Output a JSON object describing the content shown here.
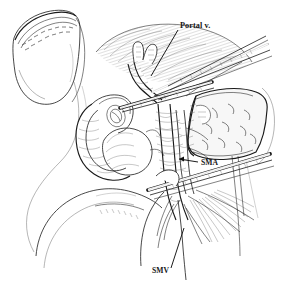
{
  "figure": {
    "kind": "medical-line-illustration",
    "technique": "pen-and-ink stipple and hatch",
    "background_color": "#ffffff",
    "ink_color": "#1a1a1a",
    "width": 281,
    "height": 284,
    "title": "",
    "caption": ""
  },
  "labels": [
    {
      "id": "portal-vein",
      "text": "Portal v.",
      "x": 180,
      "y": 28,
      "anchor": "start",
      "leader": {
        "x1": 178,
        "y1": 30,
        "x2": 151,
        "y2": 76
      },
      "arrow": false
    },
    {
      "id": "sma",
      "text": "SMA",
      "x": 201,
      "y": 165,
      "anchor": "start",
      "leader": {
        "x1": 198,
        "y1": 162,
        "x2": 177,
        "y2": 159
      },
      "arrow": true
    },
    {
      "id": "smv",
      "text": "SMV",
      "x": 152,
      "y": 273,
      "anchor": "start",
      "leader": {
        "x1": 171,
        "y1": 268,
        "x2": 184,
        "y2": 228
      },
      "arrow": false
    }
  ],
  "anatomy": [
    {
      "id": "transected-stomach",
      "label": "transected stomach with staple line",
      "region": "upper-left"
    },
    {
      "id": "duodenum",
      "label": "duodenal C-loop",
      "region": "left-center"
    },
    {
      "id": "pancreatic-head",
      "label": "pancreatic head with tumor",
      "region": "center-left"
    },
    {
      "id": "pancreas-body",
      "label": "pancreas body and tail",
      "region": "right"
    },
    {
      "id": "portal-vein-vessel",
      "label": "portal vein",
      "region": "center-top"
    },
    {
      "id": "sma-vessel",
      "label": "superior mesenteric artery",
      "region": "center-right"
    },
    {
      "id": "smv-vessel",
      "label": "superior mesenteric vein",
      "region": "lower-center"
    },
    {
      "id": "mesentery",
      "label": "small bowel mesentery",
      "region": "lower-right"
    },
    {
      "id": "jejunum",
      "label": "proximal jejunum loop",
      "region": "lower-left"
    }
  ],
  "instruments": [
    {
      "id": "vascular-clamp-upper",
      "label": "vascular clamp",
      "region": "upper-right"
    },
    {
      "id": "vascular-clamp-mid",
      "label": "vascular clamp",
      "region": "center"
    },
    {
      "id": "vascular-clamp-lower",
      "label": "vascular clamp",
      "region": "lower-right"
    },
    {
      "id": "retractor",
      "label": "retractor",
      "region": "center-right"
    }
  ]
}
